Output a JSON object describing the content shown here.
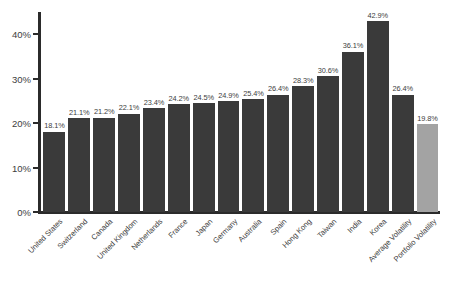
{
  "chart_data": {
    "type": "bar",
    "title": "",
    "subtitle": "",
    "xlabel": "",
    "ylabel": "",
    "ylim": [
      0,
      45
    ],
    "grid": false,
    "legend": "none",
    "y_ticks": [
      {
        "value": 0,
        "label": "0%"
      },
      {
        "value": 10,
        "label": "10%"
      },
      {
        "value": 20,
        "label": "20%"
      },
      {
        "value": 30,
        "label": "30%"
      },
      {
        "value": 40,
        "label": "40%"
      }
    ],
    "categories": [
      "United States",
      "Switzerland",
      "Canada",
      "United Kingdom",
      "Netherlands",
      "France",
      "Japan",
      "Germany",
      "Australia",
      "Spain",
      "Hong Kong",
      "Taiwan",
      "India",
      "Korea",
      "Average Volatility",
      "Portfolio Volatility"
    ],
    "values": [
      18.1,
      21.1,
      21.2,
      22.1,
      23.4,
      24.2,
      24.5,
      24.9,
      25.4,
      26.4,
      28.3,
      30.6,
      36.1,
      42.9,
      26.4,
      19.8
    ],
    "value_labels": [
      "18.1%",
      "21.1%",
      "21.2%",
      "22.1%",
      "23.4%",
      "24.2%",
      "24.5%",
      "24.9%",
      "25.4%",
      "26.4%",
      "28.3%",
      "30.6%",
      "36.1%",
      "42.9%",
      "26.4%",
      "19.8%"
    ],
    "highlight_index": 15,
    "colors": {
      "bar": "#3a3a3a",
      "bar_highlight": "#a3a3a3",
      "axis": "#2b2b2b",
      "text": "#3d3d3d",
      "background": "#ffffff"
    }
  }
}
